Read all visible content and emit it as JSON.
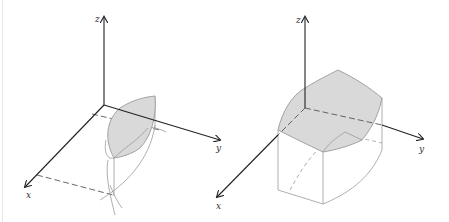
{
  "figure": {
    "left_panel": {
      "axes": {
        "x_label": "x",
        "y_label": "y",
        "z_label": "z"
      },
      "description": "Lens-shaped shaded surface above a region in the xy-plane, with projection lines"
    },
    "right_panel": {
      "axes": {
        "x_label": "x",
        "y_label": "y",
        "z_label": "z"
      },
      "description": "Curved box-like solid with shaded top surface over a rectangular region"
    },
    "colors": {
      "axis": "#222222",
      "surface_fill": "#d9d9d9",
      "edge": "#9a9a9a"
    }
  }
}
